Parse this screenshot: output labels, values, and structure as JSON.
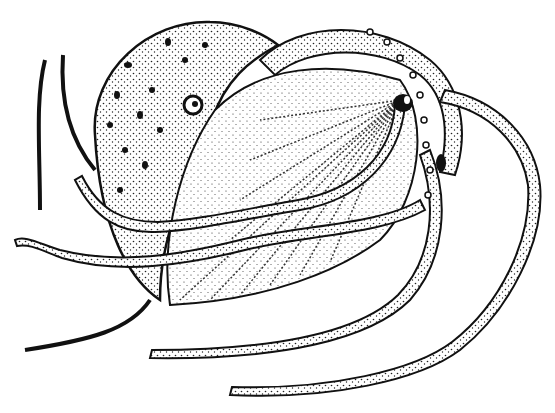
{
  "illustration": {
    "subject": "argonaut (paper nautilus) pen-and-ink stipple drawing",
    "background": "#ffffff",
    "ink": "#111111",
    "parts": {
      "shell": {
        "fill_dots": true,
        "ribbed": true
      },
      "eye_upper": {
        "cx": 193,
        "cy": 105
      },
      "eye_right": {
        "cx": 403,
        "cy": 103
      },
      "siphon_dark": {
        "cx": 441,
        "cy": 163
      }
    }
  }
}
